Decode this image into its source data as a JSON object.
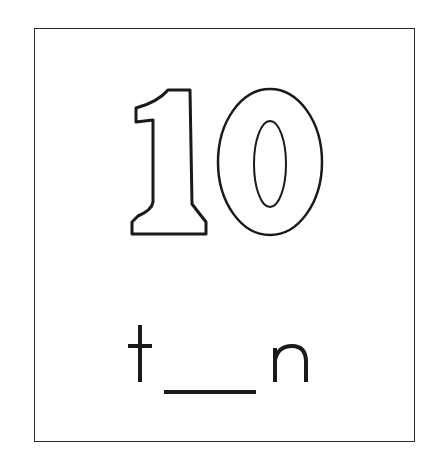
{
  "card": {
    "numeral": "10",
    "word": {
      "prefix": "t",
      "blank": "___",
      "suffix": "n",
      "answer_hidden": "e"
    }
  },
  "colors": {
    "ink": "#1a1a1a",
    "background": "#ffffff",
    "border": "#2a2a2a"
  }
}
